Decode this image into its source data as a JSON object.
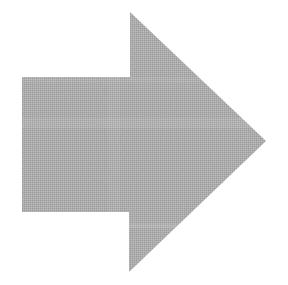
{
  "canvas": {
    "width": 288,
    "height": 285,
    "background_color": "#FFFFFF",
    "description": "Right-pointing solid block arrow rendered in dithered halftone gray on a white background"
  },
  "shape": {
    "name": "right-arrow",
    "kind": "block-arrow",
    "direction": "right",
    "fill_color": "#A8A8A8",
    "fill_texture": "dithered-halftone",
    "stroke": "none",
    "edge_softness_px": 1.5,
    "vertices": [
      {
        "label": "arrowhead-top-tip",
        "x": 130,
        "y": 12
      },
      {
        "label": "right-point",
        "x": 266,
        "y": 141
      },
      {
        "label": "arrowhead-bottom-tip",
        "x": 129,
        "y": 272
      },
      {
        "label": "shaft-bottom-right-notch",
        "x": 129,
        "y": 212
      },
      {
        "label": "shaft-bottom-left",
        "x": 22,
        "y": 212
      },
      {
        "label": "shaft-top-left",
        "x": 22,
        "y": 77
      },
      {
        "label": "shaft-top-right-notch",
        "x": 130,
        "y": 77
      }
    ],
    "path_d": "M130,12 L266,141 L129,272 L129,212 L22,212 L22,77 L130,77 Z",
    "bounding_box": {
      "x": 22,
      "y": 12,
      "width": 244,
      "height": 260
    },
    "shaft": {
      "x": 22,
      "y": 77,
      "width": 108,
      "height": 135
    },
    "head": {
      "x": 129,
      "y": 12,
      "width": 137,
      "height": 260
    }
  },
  "texture": {
    "dot_pitch_px": 2,
    "dark_tone": "#8E8E8E",
    "light_tone": "#C4C4C4",
    "base_tone": "#ABABAB",
    "noise_opacity": 0.45
  }
}
